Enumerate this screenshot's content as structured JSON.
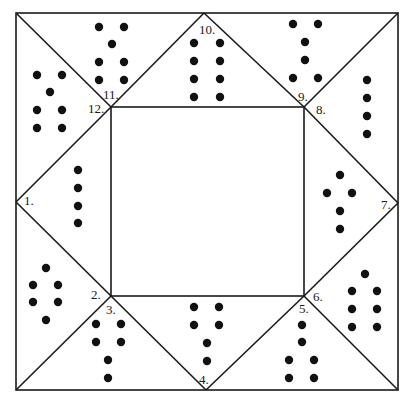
{
  "diagram": {
    "type": "dot-puzzle-frame",
    "outer_square": {
      "x1": 16,
      "y1": 13,
      "x2": 398,
      "y2": 390
    },
    "inner_square": {
      "x1": 111,
      "y1": 107,
      "x2": 304,
      "y2": 296
    },
    "midpoints": {
      "top": [
        204,
        13
      ],
      "right": [
        398,
        203
      ],
      "bottom": [
        206,
        390
      ],
      "left": [
        16,
        202
      ]
    },
    "labels": [
      {
        "text": "1.",
        "x": 24,
        "y": 205
      },
      {
        "text": "2.",
        "x": 91,
        "y": 299
      },
      {
        "text": "3.",
        "x": 106,
        "y": 314
      },
      {
        "text": "4.",
        "x": 199,
        "y": 384
      },
      {
        "text": "5.",
        "x": 299,
        "y": 313
      },
      {
        "text": "6.",
        "x": 313,
        "y": 301
      },
      {
        "text": "7.",
        "x": 381,
        "y": 209
      },
      {
        "text": "8.",
        "x": 316,
        "y": 114
      },
      {
        "text": "9.",
        "x": 298,
        "y": 101
      },
      {
        "text": "10.",
        "x": 199,
        "y": 34
      },
      {
        "text": "11.",
        "x": 103,
        "y": 99
      },
      {
        "text": "12.",
        "x": 88,
        "y": 113
      }
    ],
    "regions": [
      {
        "name": "left-upper",
        "dot_count": 7,
        "dots": [
          [
            37,
            75
          ],
          [
            62,
            75
          ],
          [
            50,
            92
          ],
          [
            37,
            110
          ],
          [
            62,
            110
          ],
          [
            37,
            128
          ],
          [
            62,
            128
          ]
        ]
      },
      {
        "name": "top-left",
        "dot_count": 7,
        "dots": [
          [
            99,
            27
          ],
          [
            124,
            27
          ],
          [
            112,
            44
          ],
          [
            99,
            62
          ],
          [
            124,
            62
          ],
          [
            99,
            80
          ],
          [
            124,
            80
          ]
        ]
      },
      {
        "name": "top-center",
        "dot_count": 8,
        "dots": [
          [
            194,
            43
          ],
          [
            220,
            43
          ],
          [
            194,
            61
          ],
          [
            220,
            61
          ],
          [
            194,
            79
          ],
          [
            220,
            79
          ],
          [
            194,
            97
          ],
          [
            220,
            97
          ]
        ]
      },
      {
        "name": "top-right",
        "dot_count": 6,
        "dots": [
          [
            293,
            24
          ],
          [
            318,
            24
          ],
          [
            305,
            42
          ],
          [
            305,
            60
          ],
          [
            293,
            78
          ],
          [
            318,
            78
          ]
        ]
      },
      {
        "name": "right-upper",
        "dot_count": 4,
        "dots": [
          [
            367,
            80
          ],
          [
            367,
            98
          ],
          [
            367,
            116
          ],
          [
            367,
            134
          ]
        ]
      },
      {
        "name": "right-middle",
        "dot_count": 5,
        "dots": [
          [
            340,
            175
          ],
          [
            327,
            193
          ],
          [
            352,
            193
          ],
          [
            340,
            211
          ],
          [
            340,
            229
          ]
        ]
      },
      {
        "name": "right-lower",
        "dot_count": 7,
        "dots": [
          [
            365,
            274
          ],
          [
            352,
            291
          ],
          [
            377,
            291
          ],
          [
            352,
            309
          ],
          [
            377,
            309
          ],
          [
            352,
            327
          ],
          [
            377,
            327
          ]
        ]
      },
      {
        "name": "bottom-right",
        "dot_count": 6,
        "dots": [
          [
            302,
            325
          ],
          [
            302,
            342
          ],
          [
            289,
            360
          ],
          [
            314,
            360
          ],
          [
            289,
            378
          ],
          [
            314,
            378
          ]
        ]
      },
      {
        "name": "bottom-center",
        "dot_count": 6,
        "dots": [
          [
            194,
            307
          ],
          [
            219,
            307
          ],
          [
            194,
            325
          ],
          [
            219,
            325
          ],
          [
            207,
            343
          ],
          [
            207,
            361
          ]
        ]
      },
      {
        "name": "bottom-left",
        "dot_count": 6,
        "dots": [
          [
            96,
            324
          ],
          [
            121,
            324
          ],
          [
            96,
            342
          ],
          [
            121,
            342
          ],
          [
            108,
            360
          ],
          [
            108,
            378
          ]
        ]
      },
      {
        "name": "left-lower",
        "dot_count": 6,
        "dots": [
          [
            46,
            268
          ],
          [
            33,
            285
          ],
          [
            58,
            285
          ],
          [
            33,
            302
          ],
          [
            58,
            302
          ],
          [
            46,
            320
          ]
        ]
      },
      {
        "name": "left-middle",
        "dot_count": 4,
        "dots": [
          [
            78,
            170
          ],
          [
            78,
            188
          ],
          [
            78,
            206
          ],
          [
            78,
            223
          ]
        ]
      }
    ]
  }
}
